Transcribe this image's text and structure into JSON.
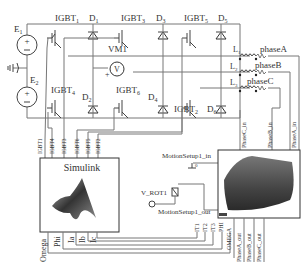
{
  "diagram": {
    "sources": [
      {
        "id": "E1",
        "label": "E",
        "sub": "1"
      },
      {
        "id": "E2",
        "label": "E",
        "sub": "2"
      }
    ],
    "ground_label": "0",
    "igbts": [
      {
        "label": "IGBT",
        "sub": "1"
      },
      {
        "label": "IGBT",
        "sub": "3"
      },
      {
        "label": "IGBT",
        "sub": "5"
      },
      {
        "label": "IGBT",
        "sub": "4"
      },
      {
        "label": "IGBT",
        "sub": "6"
      },
      {
        "label": "IGBT",
        "sub": "2"
      }
    ],
    "diodes": [
      {
        "label": "D",
        "sub": "1"
      },
      {
        "label": "D",
        "sub": "3"
      },
      {
        "label": "D",
        "sub": "5"
      },
      {
        "label": "D",
        "sub": "2"
      },
      {
        "label": "D",
        "sub": "4"
      },
      {
        "label": "D",
        "sub": "6"
      }
    ],
    "voltmeter": {
      "label": "VM1",
      "symbol": "V",
      "plus": "+"
    },
    "inductors": [
      {
        "label": "L",
        "sub": "1",
        "phase": "phaseA"
      },
      {
        "label": "L",
        "sub": "2",
        "phase": "phaseB"
      },
      {
        "label": "L",
        "sub": "3",
        "phase": "phaseC"
      }
    ],
    "gate_signals": [
      "IGBT1",
      "IGBT4",
      "IGBT3",
      "IGBT6",
      "IGBT5",
      "IGBT2"
    ],
    "phase_inputs": [
      "PhaseC_in",
      "PhaseB_in",
      "PhaseA_in"
    ],
    "simulink": {
      "title": "Simulink",
      "ports": [
        "Omega",
        "Phi",
        "Ia",
        "Ib",
        "Ic"
      ]
    },
    "motion": {
      "in_label": "MotionSetup1_in",
      "in_value": "0",
      "out_label": "MotionSetup1_out",
      "speed_label": "V_ROT1",
      "outputs": [
        "IT1",
        "IT2",
        "IT3",
        "PHI",
        "OMEGA",
        "PhaseA_out",
        "PhaseB_out",
        "PhaseC_out"
      ]
    }
  }
}
